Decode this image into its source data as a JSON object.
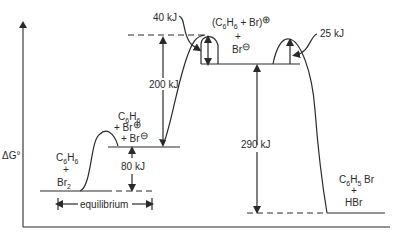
{
  "diagram": {
    "type": "energy-profile",
    "axis": {
      "y_label": "ΔG°"
    },
    "states": {
      "reactants": {
        "line1": "C6H6",
        "line2": "+",
        "line3": "Br2",
        "line1_main": "C",
        "line1_sub1": "6",
        "line1_mid": "H",
        "line1_sub2": "6",
        "line3_main": "Br",
        "line3_sub": "2"
      },
      "intermediate1": {
        "line1_main": "C",
        "line1_sub1": "6",
        "line1_mid": "H",
        "line1_sub2": "6",
        "line2": "+ Br",
        "line3": "+ Br",
        "charge_plus": "⊕",
        "charge_minus": "⊖"
      },
      "intermediate2": {
        "line1": "(C6H6 + Br)",
        "line1_open": "(C",
        "line1_sub1": "6",
        "line1_mid": "H",
        "line1_sub2": "6",
        "line1_close": " + Br)",
        "charge_plus": "⊕",
        "plus": "+",
        "line3": "Br",
        "charge_minus": "⊖"
      },
      "products": {
        "line1_main": "C",
        "line1_sub1": "6",
        "line1_mid": "H",
        "line1_sub2": "5",
        "line1_end": " Br",
        "line2": "+",
        "line3": "HBr"
      }
    },
    "energies": {
      "barrier_small": "40 kJ",
      "rise_200": "200 kJ",
      "barrier_25": "25 kJ",
      "drop_290": "290 kJ",
      "gap_80": "80 kJ"
    },
    "annotations": {
      "equilibrium": "equilibrium"
    }
  }
}
